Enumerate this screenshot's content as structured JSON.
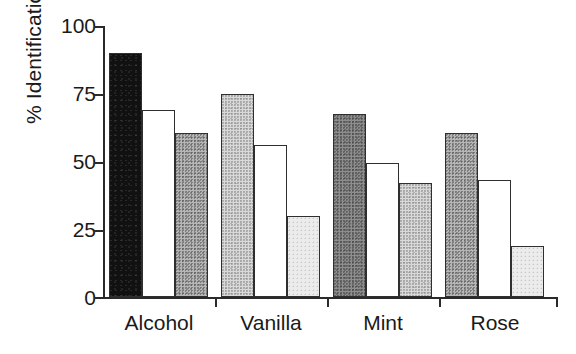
{
  "chart_data": {
    "type": "bar",
    "title": "",
    "subtitle": "",
    "xlabel": "",
    "ylabel": "% Identification",
    "categories": [
      "Alcohol",
      "Vanilla",
      "Mint",
      "Rose"
    ],
    "ylim": [
      0,
      100
    ],
    "yticks": [
      0,
      25,
      50,
      75,
      100
    ],
    "ytick_labels": [
      "0",
      "25",
      "50",
      "75",
      "100"
    ],
    "grid": false,
    "legend": false,
    "legend_position": "none",
    "series": [
      {
        "name": "series-1",
        "fill": "fill-black",
        "values": [
          90,
          75,
          67.5,
          60.5
        ]
      },
      {
        "name": "series-2",
        "fill": "fill-white",
        "values": [
          69,
          56,
          49.5,
          43
        ]
      },
      {
        "name": "series-3",
        "fill": "fill-midgray",
        "values": [
          60.5,
          30,
          42,
          19
        ]
      }
    ],
    "bars": [
      {
        "group": "Alcohol",
        "index": 0,
        "value": 90,
        "fill": "fill-black"
      },
      {
        "group": "Alcohol",
        "index": 1,
        "value": 69,
        "fill": "fill-white"
      },
      {
        "group": "Alcohol",
        "index": 2,
        "value": 60.5,
        "fill": "fill-midgray"
      },
      {
        "group": "Vanilla",
        "index": 0,
        "value": 75,
        "fill": "fill-lightgray"
      },
      {
        "group": "Vanilla",
        "index": 1,
        "value": 56,
        "fill": "fill-white"
      },
      {
        "group": "Vanilla",
        "index": 2,
        "value": 30,
        "fill": "fill-palegray"
      },
      {
        "group": "Mint",
        "index": 0,
        "value": 67.5,
        "fill": "fill-darkgray"
      },
      {
        "group": "Mint",
        "index": 1,
        "value": 49.5,
        "fill": "fill-white"
      },
      {
        "group": "Mint",
        "index": 2,
        "value": 42,
        "fill": "fill-lightgray"
      },
      {
        "group": "Rose",
        "index": 0,
        "value": 60.5,
        "fill": "fill-midgray"
      },
      {
        "group": "Rose",
        "index": 1,
        "value": 43,
        "fill": "fill-white"
      },
      {
        "group": "Rose",
        "index": 2,
        "value": 19,
        "fill": "fill-palegray"
      }
    ]
  }
}
